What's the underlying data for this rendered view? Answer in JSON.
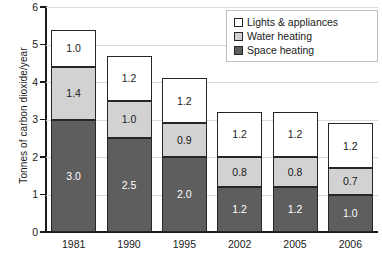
{
  "chart_data": {
    "type": "bar",
    "subtype": "stacked-bar",
    "title": "",
    "xlabel": "",
    "ylabel": "Tonnes of carbon dioxide/year",
    "categories": [
      "1981",
      "1990",
      "1995",
      "2002",
      "2005",
      "2006"
    ],
    "ylim": [
      0,
      6
    ],
    "yticks": [
      0,
      1,
      2,
      3,
      4,
      5,
      6
    ],
    "ytick_labels": [
      "0",
      "1",
      "2",
      "3",
      "4",
      "5",
      "6"
    ],
    "grid": true,
    "grid_axis": "y",
    "legend_position": "top-right",
    "stack_order_bottom_to_top": [
      "Space heating",
      "Water heating",
      "Lights & appliances"
    ],
    "series": [
      {
        "name": "Space heating",
        "color": "#5e5e5e",
        "values": [
          3.0,
          2.5,
          2.0,
          1.2,
          1.2,
          1.0
        ],
        "labels": [
          "3.0",
          "2.5",
          "2.0",
          "1.2",
          "1.2",
          "1.0"
        ]
      },
      {
        "name": "Water heating",
        "color": "#d2d2d2",
        "values": [
          1.4,
          1.0,
          0.9,
          0.8,
          0.8,
          0.7
        ],
        "labels": [
          "1.4",
          "1.0",
          "0.9",
          "0.8",
          "0.8",
          "0.7"
        ]
      },
      {
        "name": "Lights & appliances",
        "color": "#ffffff",
        "values": [
          1.0,
          1.2,
          1.2,
          1.2,
          1.2,
          1.2
        ],
        "labels": [
          "1.0",
          "1.2",
          "1.2",
          "1.2",
          "1.2",
          "1.2"
        ]
      }
    ],
    "totals": [
      5.4,
      4.7,
      4.1,
      3.2,
      3.2,
      2.9
    ]
  },
  "legend": {
    "items": [
      {
        "label": "Lights & appliances",
        "swatch": "legend-swatch-lights"
      },
      {
        "label": "Water heating",
        "swatch": "legend-swatch-water"
      },
      {
        "label": "Space heating",
        "swatch": "legend-swatch-space"
      }
    ]
  },
  "colors": {
    "lights": "#ffffff",
    "water": "#d2d2d2",
    "space": "#5e5e5e",
    "axis": "#1a1a1a",
    "gridline": "#d9d9d9",
    "legend_border": "#bfbfbf"
  }
}
